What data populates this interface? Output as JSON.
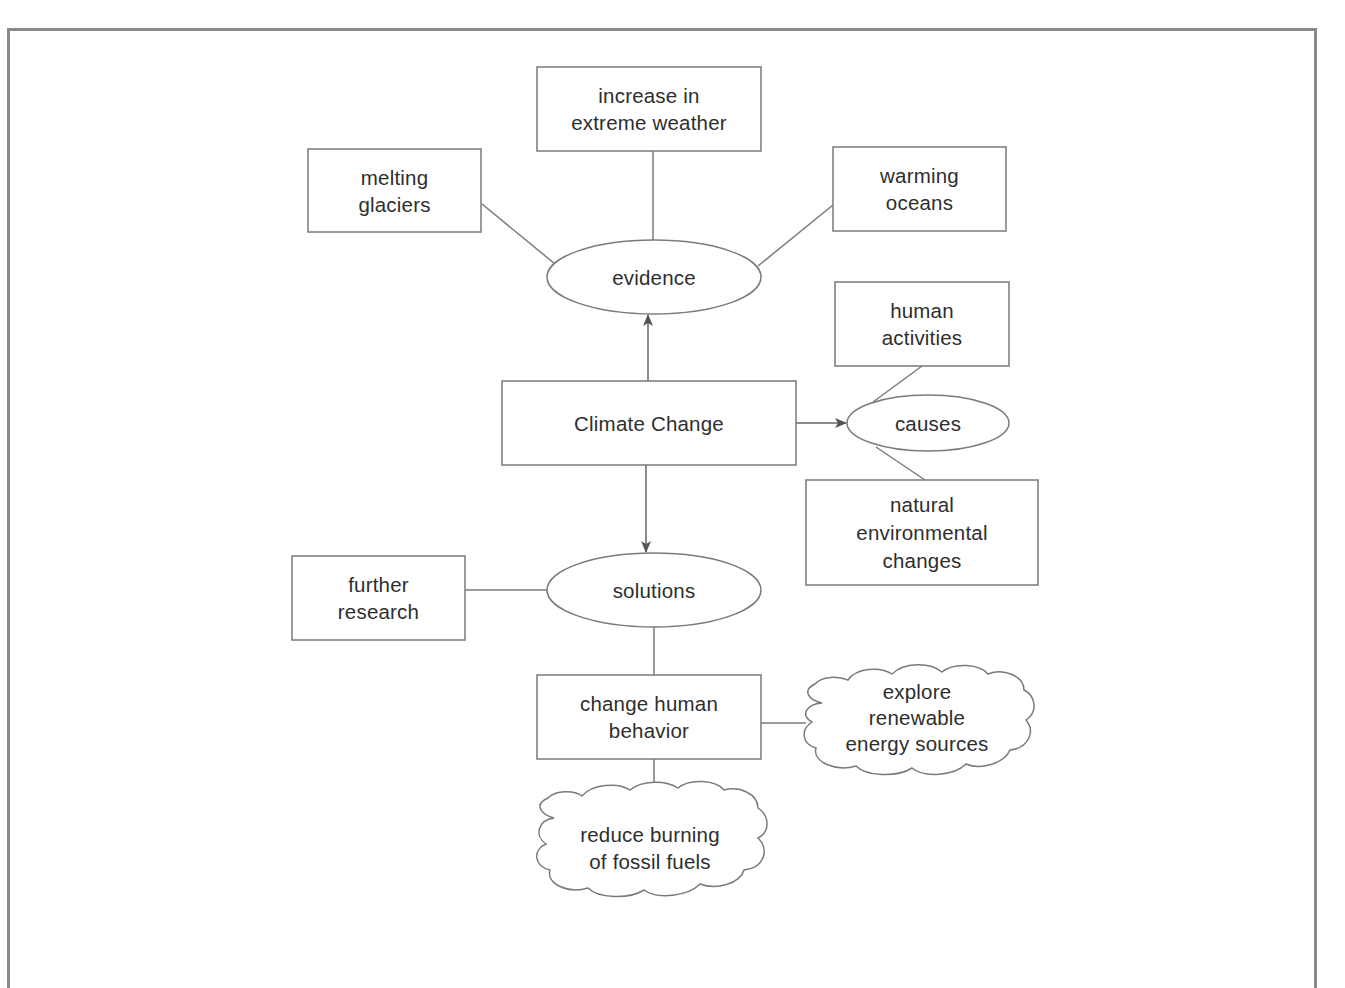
{
  "diagram": {
    "title": "Climate Change",
    "colors": {
      "stroke": "#7a7a7a",
      "frame": "#8a8a8a",
      "text": "#2e2e2e",
      "background": "#ffffff"
    },
    "nodes": {
      "climate_change": {
        "label": "Climate Change",
        "shape": "rectangle"
      },
      "evidence": {
        "label": "evidence",
        "shape": "ellipse"
      },
      "melting_glaciers": {
        "label": "melting\nglaciers",
        "shape": "rectangle"
      },
      "extreme_weather": {
        "label": "increase in\nextreme weather",
        "shape": "rectangle"
      },
      "warming_oceans": {
        "label": "warming\noceans",
        "shape": "rectangle"
      },
      "causes": {
        "label": "causes",
        "shape": "ellipse"
      },
      "human_activities": {
        "label": "human\nactivities",
        "shape": "rectangle"
      },
      "natural_changes": {
        "label": "natural\nenvironmental\nchanges",
        "shape": "rectangle"
      },
      "solutions": {
        "label": "solutions",
        "shape": "ellipse"
      },
      "further_research": {
        "label": "further\nresearch",
        "shape": "rectangle"
      },
      "change_behavior": {
        "label": "change human\nbehavior",
        "shape": "rectangle"
      },
      "renewable_energy": {
        "label": "explore\nrenewable\nenergy sources",
        "shape": "cloud"
      },
      "reduce_fossil_fuels": {
        "label": "reduce burning\nof fossil fuels",
        "shape": "cloud"
      }
    },
    "edges": [
      {
        "from": "climate_change",
        "to": "evidence",
        "arrow": true
      },
      {
        "from": "climate_change",
        "to": "causes",
        "arrow": true
      },
      {
        "from": "climate_change",
        "to": "solutions",
        "arrow": true
      },
      {
        "from": "evidence",
        "to": "melting_glaciers",
        "arrow": false
      },
      {
        "from": "evidence",
        "to": "extreme_weather",
        "arrow": false
      },
      {
        "from": "evidence",
        "to": "warming_oceans",
        "arrow": false
      },
      {
        "from": "causes",
        "to": "human_activities",
        "arrow": false
      },
      {
        "from": "causes",
        "to": "natural_changes",
        "arrow": false
      },
      {
        "from": "solutions",
        "to": "further_research",
        "arrow": false
      },
      {
        "from": "solutions",
        "to": "change_behavior",
        "arrow": false
      },
      {
        "from": "change_behavior",
        "to": "renewable_energy",
        "arrow": false
      },
      {
        "from": "change_behavior",
        "to": "reduce_fossil_fuels",
        "arrow": false
      }
    ]
  }
}
